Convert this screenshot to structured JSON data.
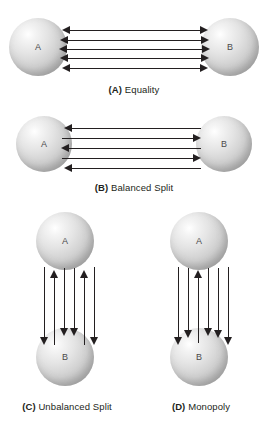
{
  "figure": {
    "node_labels": {
      "a": "A",
      "b": "B"
    },
    "panels": [
      {
        "id": "A",
        "tag": "(A)",
        "title": "Equality",
        "caption": "(A) Equality",
        "orientation": "horizontal",
        "nodes": [
          "A",
          "B"
        ],
        "flows": {
          "a_to_b": 5,
          "b_to_a": 5,
          "total_links": 5
        },
        "arrows": [
          {
            "index": 1,
            "direction": "both"
          },
          {
            "index": 2,
            "direction": "both"
          },
          {
            "index": 3,
            "direction": "both"
          },
          {
            "index": 4,
            "direction": "both"
          },
          {
            "index": 5,
            "direction": "both"
          }
        ]
      },
      {
        "id": "B",
        "tag": "(B)",
        "title": "Balanced Split",
        "caption": "(B) Balanced Split",
        "orientation": "horizontal",
        "nodes": [
          "A",
          "B"
        ],
        "flows": {
          "a_to_b": 2,
          "b_to_a": 3,
          "total_links": 5
        },
        "arrows": [
          {
            "index": 1,
            "direction": "left"
          },
          {
            "index": 2,
            "direction": "right"
          },
          {
            "index": 3,
            "direction": "left"
          },
          {
            "index": 4,
            "direction": "right"
          },
          {
            "index": 5,
            "direction": "left"
          }
        ]
      },
      {
        "id": "C",
        "tag": "(C)",
        "title": "Unbalanced Split",
        "caption": "(C) Unbalanced Split",
        "orientation": "vertical",
        "nodes": [
          "A",
          "B"
        ],
        "flows": {
          "a_to_b": 4,
          "b_to_a": 2,
          "total_links": 6
        },
        "arrows": [
          {
            "index": 1,
            "direction": "down"
          },
          {
            "index": 2,
            "direction": "up"
          },
          {
            "index": 3,
            "direction": "down"
          },
          {
            "index": 4,
            "direction": "down"
          },
          {
            "index": 5,
            "direction": "up"
          },
          {
            "index": 6,
            "direction": "down"
          }
        ]
      },
      {
        "id": "D",
        "tag": "(D)",
        "title": "Monopoly",
        "caption": "(D) Monopoly",
        "orientation": "vertical",
        "nodes": [
          "A",
          "B"
        ],
        "flows": {
          "a_to_b": 5,
          "b_to_a": 1,
          "total_links": 6
        },
        "arrows": [
          {
            "index": 1,
            "direction": "down"
          },
          {
            "index": 2,
            "direction": "down"
          },
          {
            "index": 3,
            "direction": "up"
          },
          {
            "index": 4,
            "direction": "down"
          },
          {
            "index": 5,
            "direction": "down"
          },
          {
            "index": 6,
            "direction": "down"
          }
        ]
      }
    ],
    "colors": {
      "arrow": "#231f20",
      "text": "#231f20",
      "sphere_light": "#ffffff",
      "sphere_mid": "#cfcfcf",
      "sphere_dark": "#8e8e8e",
      "background": "#ffffff"
    }
  }
}
